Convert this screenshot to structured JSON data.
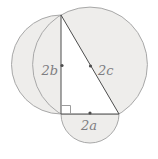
{
  "figure": {
    "type": "geometry-diagram",
    "labels": {
      "left_circle": "2b",
      "right_circle": "2c",
      "bottom_circle": "2a"
    },
    "colors": {
      "circle_fill": "#eeedeb",
      "circle_stroke": "#a8a8a8",
      "triangle_fill": "#ffffff",
      "triangle_stroke": "#4d4d4d",
      "right_angle_stroke": "#9c9c9c",
      "dot_fill": "#4d4d4d",
      "label_color": "#7e7e82"
    },
    "geometry": {
      "canvas_width": "158",
      "canvas_height": "159",
      "triangle_points": "61,15 61,114 119,114",
      "left_circle": {
        "cx": "61",
        "cy": "64.5",
        "r": "49.5"
      },
      "right_circle": {
        "cx": "90",
        "cy": "64.5",
        "r": "57.4"
      },
      "bottom_semicircle_path": "M 61 114 A 29 29 0 0 0 119 114 Z",
      "right_angle_path": "M 61 105.5 L 70.5 105.5 L 70.5 114",
      "dots": {
        "left": {
          "cx": "62",
          "cy": "65.5",
          "r": "1.6"
        },
        "right": {
          "cx": "90.5",
          "cy": "66",
          "r": "1.6"
        },
        "bottom": {
          "cx": "90",
          "cy": "113",
          "r": "1.6"
        }
      },
      "label_positions": {
        "left": {
          "x": "58",
          "y": "75"
        },
        "right": {
          "x": "98",
          "y": "75"
        },
        "bottom": {
          "x": "89",
          "y": "130"
        }
      }
    }
  }
}
